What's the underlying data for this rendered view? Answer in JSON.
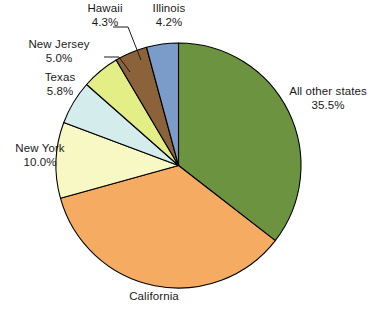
{
  "chart_data": {
    "type": "pie",
    "title": "",
    "subtitle": "",
    "xlabel": "",
    "ylabel": "",
    "legend_position": "labels-outside",
    "grid": false,
    "start_angle_deg": 0,
    "direction": "clockwise",
    "categories": [
      "All other states",
      "California",
      "New York",
      "Texas",
      "New Jersey",
      "Hawaii",
      "Illinois"
    ],
    "values": [
      35.5,
      35.2,
      10.0,
      5.8,
      5.0,
      4.3,
      4.2
    ],
    "value_labels": [
      "35.5%",
      "",
      "10.0%",
      "5.8%",
      "5.0%",
      "4.3%",
      "4.2%"
    ],
    "colors": [
      "#6b9340",
      "#f5ac62",
      "#f7f8c4",
      "#d4ecec",
      "#e4ee86",
      "#8b6239",
      "#7b9cc8"
    ],
    "slices": [
      {
        "name": "All other states",
        "percent": 35.5,
        "percent_label": "35.5%",
        "color": "#6b9340",
        "label_shown": true
      },
      {
        "name": "California",
        "percent": 35.2,
        "percent_label": "",
        "color": "#f5ac62",
        "label_shown": false
      },
      {
        "name": "New York",
        "percent": 10.0,
        "percent_label": "10.0%",
        "color": "#f7f8c4",
        "label_shown": true
      },
      {
        "name": "Texas",
        "percent": 5.8,
        "percent_label": "5.8%",
        "color": "#d4ecec",
        "label_shown": true
      },
      {
        "name": "New Jersey",
        "percent": 5.0,
        "percent_label": "5.0%",
        "color": "#e4ee86",
        "label_shown": true
      },
      {
        "name": "Hawaii",
        "percent": 4.3,
        "percent_label": "4.3%",
        "color": "#8b6239",
        "label_shown": true
      },
      {
        "name": "Illinois",
        "percent": 4.2,
        "percent_label": "4.2%",
        "color": "#7b9cc8",
        "label_shown": true
      }
    ]
  },
  "labels": {
    "all_other_states": {
      "name": "All other states",
      "percent": "35.5%"
    },
    "california": {
      "name": "California",
      "percent": ""
    },
    "new_york": {
      "name": "New York",
      "percent": "10.0%"
    },
    "texas": {
      "name": "Texas",
      "percent": "5.8%"
    },
    "new_jersey": {
      "name": "New Jersey",
      "percent": "5.0%"
    },
    "hawaii": {
      "name": "Hawaii",
      "percent": "4.3%"
    },
    "illinois": {
      "name": "Illinois",
      "percent": "4.2%"
    }
  },
  "style": {
    "background": "#ffffff",
    "outline": "#000000",
    "text": "#1a1a1a"
  }
}
